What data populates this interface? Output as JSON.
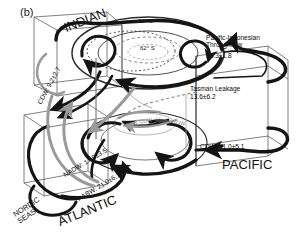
{
  "figure": {
    "panel_letter": "(b)",
    "type": "global-overturning-circulation-schematic"
  },
  "basins": {
    "indian": "INDIAN",
    "pacific": "PACIFIC",
    "atlantic": "ATLANTIC",
    "nordic": "NORDIC\nSEAS"
  },
  "latitudes": {
    "outer": "32° S",
    "inner": "62° S"
  },
  "fluxes": {
    "throughflow_name": "Pacific-Indonesian\nThroughflow",
    "throughflow_value": "13.3±1.8",
    "tasman_name": "Tasman Leakage",
    "tasman_value": "13.6±6.2",
    "cdw_pacific": "CDW: 11.0±5.1",
    "cdw_indian": "CDW: 9.2±2.7",
    "nadw": "NADW: 17.9±3.5",
    "aabw": "AABW: 21.0±6.1"
  },
  "water_masses": {
    "lower_cdw": "Lower CDW",
    "upper_cdw": "Upper CDW"
  },
  "colors": {
    "stroke_dark": "#141414",
    "stroke_box": "#55565a",
    "stroke_gray_flow": "#9a9a9c",
    "stroke_mid_flow": "#6e6f73",
    "background": "#ffffff"
  }
}
